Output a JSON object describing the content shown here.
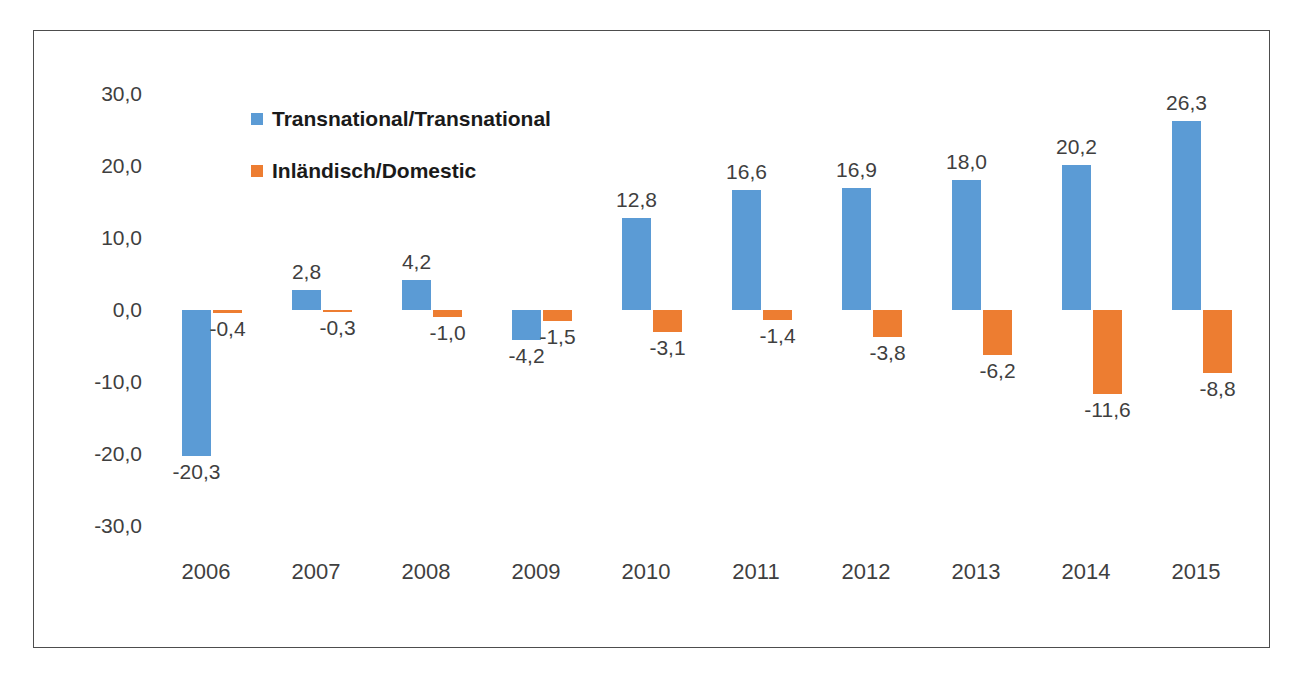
{
  "chart_data": {
    "type": "bar",
    "title": "",
    "subtitle": "",
    "xlabel": "",
    "ylabel": "",
    "ylim": [
      -30.0,
      30.0
    ],
    "y_ticks": [
      "30,0",
      "20,0",
      "10,0",
      "0,0",
      "-10,0",
      "-20,0",
      "-30,0"
    ],
    "y_tick_values": [
      30.0,
      20.0,
      10.0,
      0.0,
      -10.0,
      -20.0,
      -30.0
    ],
    "grid": false,
    "legend_position": "inside-top-left",
    "decimal_separator": ",",
    "categories": [
      "2006",
      "2007",
      "2008",
      "2009",
      "2010",
      "2011",
      "2012",
      "2013",
      "2014",
      "2015"
    ],
    "series": [
      {
        "name": "Transnational/Transnational",
        "color": "#5b9bd5",
        "values": [
          -20.3,
          2.8,
          4.2,
          -4.2,
          12.8,
          16.6,
          16.9,
          18.0,
          20.2,
          26.3
        ],
        "labels": [
          "-20,3",
          "2,8",
          "4,2",
          "-4,2",
          "12,8",
          "16,6",
          "16,9",
          "18,0",
          "20,2",
          "26,3"
        ]
      },
      {
        "name": "Inländisch/Domestic",
        "color": "#ed7d31",
        "values": [
          -0.4,
          -0.3,
          -1.0,
          -1.5,
          -3.1,
          -1.4,
          -3.8,
          -6.2,
          -11.6,
          -8.8
        ],
        "labels": [
          "-0,4",
          "-0,3",
          "-1,0",
          "-1,5",
          "-3,1",
          "-1,4",
          "-3,8",
          "-6,2",
          "-11,6",
          "-8,8"
        ]
      }
    ]
  },
  "legend": {
    "items": [
      {
        "label": "Transnational/Transnational",
        "color": "#5b9bd5"
      },
      {
        "label": "Inländisch/Domestic",
        "color": "#ed7d31"
      }
    ]
  },
  "colors": {
    "series_blue": "#5b9bd5",
    "series_orange": "#ed7d31",
    "text": "#3f3f3f",
    "frame_border": "#4d4d4d",
    "background": "#ffffff"
  }
}
